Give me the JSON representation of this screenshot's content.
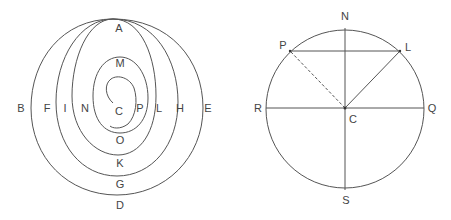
{
  "figures": {
    "left": {
      "description": "Nested curves tangent at top point A with inner spiral ending at C",
      "labels": {
        "A": "A",
        "M": "M",
        "C": "C",
        "O": "O",
        "K": "K",
        "G": "G",
        "D": "D",
        "B": "B",
        "F": "F",
        "I": "I",
        "N": "N",
        "P": "P",
        "L": "L",
        "H": "H",
        "E": "E"
      }
    },
    "right": {
      "description": "Circle with center C, diameters NS and RQ, chord PL, radius CL solid and CP dashed",
      "labels": {
        "N": "N",
        "S": "S",
        "R": "R",
        "Q": "Q",
        "P": "P",
        "L": "L",
        "C": "C"
      }
    }
  },
  "colors": {
    "stroke": "#555555",
    "text": "#444444",
    "background": "#ffffff"
  }
}
